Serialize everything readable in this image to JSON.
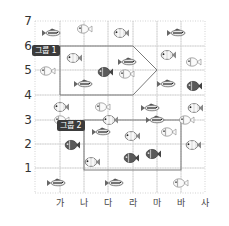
{
  "diagram": {
    "type": "coordinate-grid",
    "y_axis": {
      "labels": [
        "7",
        "6",
        "5",
        "4",
        "3",
        "2",
        "1"
      ]
    },
    "x_axis": {
      "labels": [
        "가",
        "나",
        "다",
        "라",
        "마",
        "바",
        "사"
      ]
    },
    "groups": [
      {
        "label": "그룹 1",
        "shape": "pentagon-arrow"
      },
      {
        "label": "그룹 2",
        "shape": "rectangle"
      }
    ],
    "fish_types": [
      "perch",
      "clownfish-outline",
      "clownfish-dark",
      "clownfish-light"
    ],
    "fish": [
      {
        "type": "perch",
        "x": 53,
        "y": 33
      },
      {
        "type": "clownfish-outline",
        "x": 83,
        "y": 29
      },
      {
        "type": "clownfish-light",
        "x": 120,
        "y": 33
      },
      {
        "type": "perch",
        "x": 178,
        "y": 33
      },
      {
        "type": "clownfish-light",
        "x": 73,
        "y": 58
      },
      {
        "type": "perch",
        "x": 129,
        "y": 62
      },
      {
        "type": "clownfish-light",
        "x": 167,
        "y": 55
      },
      {
        "type": "clownfish-outline",
        "x": 192,
        "y": 62
      },
      {
        "type": "clownfish-outline",
        "x": 46,
        "y": 71
      },
      {
        "type": "clownfish-dark",
        "x": 104,
        "y": 72
      },
      {
        "type": "clownfish-outline",
        "x": 125,
        "y": 74
      },
      {
        "type": "perch",
        "x": 168,
        "y": 84
      },
      {
        "type": "clownfish-dark",
        "x": 193,
        "y": 86
      },
      {
        "type": "perch",
        "x": 85,
        "y": 84
      },
      {
        "type": "clownfish-light",
        "x": 60,
        "y": 107
      },
      {
        "type": "clownfish-outline",
        "x": 101,
        "y": 107
      },
      {
        "type": "perch",
        "x": 152,
        "y": 108
      },
      {
        "type": "clownfish-light",
        "x": 194,
        "y": 108
      },
      {
        "type": "clownfish-outline",
        "x": 60,
        "y": 120
      },
      {
        "type": "clownfish-light",
        "x": 109,
        "y": 120
      },
      {
        "type": "perch",
        "x": 157,
        "y": 120
      },
      {
        "type": "clownfish-outline",
        "x": 185,
        "y": 120
      },
      {
        "type": "clownfish-dark",
        "x": 71,
        "y": 145
      },
      {
        "type": "perch",
        "x": 103,
        "y": 132
      },
      {
        "type": "clownfish-light",
        "x": 131,
        "y": 136
      },
      {
        "type": "clownfish-outline",
        "x": 167,
        "y": 132
      },
      {
        "type": "clownfish-light",
        "x": 192,
        "y": 145
      },
      {
        "type": "clownfish-light",
        "x": 91,
        "y": 162
      },
      {
        "type": "clownfish-dark",
        "x": 130,
        "y": 158
      },
      {
        "type": "clownfish-dark",
        "x": 152,
        "y": 154
      },
      {
        "type": "perch",
        "x": 58,
        "y": 183
      },
      {
        "type": "perch",
        "x": 116,
        "y": 183
      },
      {
        "type": "clownfish-outline",
        "x": 179,
        "y": 183
      }
    ]
  }
}
